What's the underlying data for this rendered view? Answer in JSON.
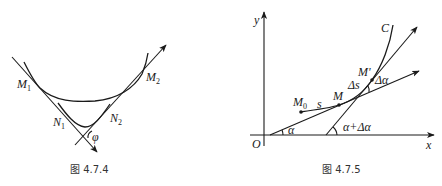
{
  "figures": [
    {
      "id": "left",
      "caption": "图 4.7.4",
      "labels": {
        "m1": "M",
        "m1_sub": "1",
        "m2": "M",
        "m2_sub": "2",
        "n1": "N",
        "n1_sub": "1",
        "n2": "N",
        "n2_sub": "2",
        "angle": "φ"
      }
    },
    {
      "id": "right",
      "caption": "图 4.7.5",
      "labels": {
        "y_axis": "y",
        "x_axis": "x",
        "origin": "O",
        "curve": "C",
        "m0": "M",
        "m0_sub": "0",
        "s": "s",
        "m": "M",
        "m_prime": "M'",
        "delta_s": "Δs",
        "delta_alpha": "Δα",
        "alpha": "α",
        "alpha_plus_delta": "α+Δα"
      }
    }
  ],
  "colors": {
    "stroke": "#1a1a1a",
    "caption": "#333333",
    "background": "#ffffff"
  }
}
